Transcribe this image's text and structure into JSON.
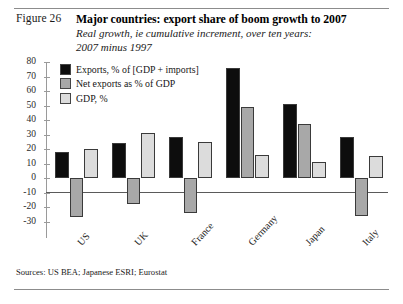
{
  "figure": {
    "label": "Figure 26",
    "title": "Major countries: export share of boom growth to 2007",
    "subtitle_line1": "Real growth, ie cumulative increment, over ten years:",
    "subtitle_line2": "2007 minus 1997",
    "source": "Sources: US BEA; Japanese ESRI; Eurostat"
  },
  "chart_data": {
    "type": "bar",
    "title": "Major countries: export share of boom growth to 2007",
    "subtitle": "Real growth, ie cumulative increment, over ten years: 2007 minus 1997",
    "xlabel": "",
    "ylabel": "",
    "ylim": [
      -30,
      80
    ],
    "yticks": [
      80,
      70,
      60,
      50,
      40,
      30,
      20,
      10,
      0,
      -10,
      -20,
      -30
    ],
    "ytick_labels": [
      "80",
      "70",
      "60",
      "50",
      "40",
      "30",
      "20",
      "10",
      "0",
      "-10",
      "-20",
      "-30"
    ],
    "grid": false,
    "legend_position": "top-left",
    "categories": [
      "US",
      "UK",
      "France",
      "Germany",
      "Japan",
      "Italy"
    ],
    "series": [
      {
        "name": "Exports, % of [GDP + imports]",
        "color": "#0d0d0d",
        "values": [
          18,
          24,
          28,
          76,
          51,
          28
        ]
      },
      {
        "name": "Net exports as % of GDP",
        "color": "#a8a8a8",
        "values": [
          -27,
          -18,
          -24,
          49,
          37,
          -26
        ]
      },
      {
        "name": "GDP, %",
        "color": "#dcdcdc",
        "values": [
          20,
          31,
          25,
          16,
          11,
          15
        ]
      }
    ]
  }
}
